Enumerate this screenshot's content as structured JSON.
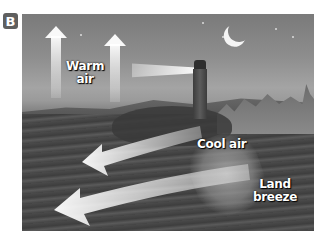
{
  "figure": {
    "panel_label": "B",
    "scene_description": "Night coastal scene with lighthouse, crescent moon, town on shore, and sea",
    "labels": {
      "warm_air": "Warm\nair",
      "warm_air_line1": "Warm",
      "warm_air_line2": "air",
      "cool_air": "Cool air",
      "land_breeze": "Land breeze"
    },
    "arrows": [
      {
        "name": "warm-air-rising-arrow-1",
        "direction": "up"
      },
      {
        "name": "warm-air-rising-arrow-2",
        "direction": "up"
      },
      {
        "name": "cool-air-arrow",
        "direction": "left-seaward"
      },
      {
        "name": "land-breeze-arrow",
        "direction": "left-seaward"
      }
    ],
    "colors": {
      "badge_bg": "#5f5f5f",
      "arrow": "#ffffff",
      "label_text": "#ffffff"
    }
  }
}
